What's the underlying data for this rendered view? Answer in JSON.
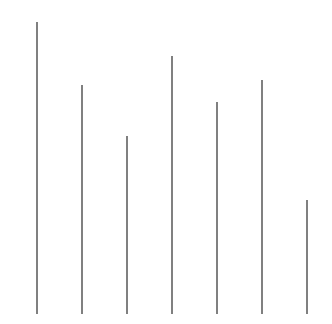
{
  "chart_data": {
    "type": "bar",
    "title": "",
    "subtitle": "",
    "xlabel": "",
    "ylabel": "",
    "categories": [
      "1",
      "2",
      "3",
      "4",
      "5",
      "6",
      "7"
    ],
    "values": [
      292,
      229,
      178,
      258,
      212,
      234,
      114
    ],
    "ylim": [
      0,
      302
    ],
    "xlim": [
      0,
      332
    ],
    "grid": false,
    "legend": null,
    "legend_position": "none",
    "tick_labels_x": [],
    "tick_labels_y": [],
    "annotations": [],
    "bar_color": "#808080",
    "background_color": "#ffffff",
    "bar_width_px": 2,
    "baseline_y_px": 314,
    "bars": [
      {
        "label": "1",
        "value": 292,
        "x_px": 36,
        "top_px": 22,
        "height_px": 292,
        "width_px": 2,
        "color": "#808080"
      },
      {
        "label": "2",
        "value": 229,
        "x_px": 81,
        "top_px": 85,
        "height_px": 229,
        "width_px": 2,
        "color": "#808080"
      },
      {
        "label": "3",
        "value": 178,
        "x_px": 126,
        "top_px": 136,
        "height_px": 178,
        "width_px": 2,
        "color": "#808080"
      },
      {
        "label": "4",
        "value": 258,
        "x_px": 171,
        "top_px": 56,
        "height_px": 258,
        "width_px": 2,
        "color": "#808080"
      },
      {
        "label": "5",
        "value": 212,
        "x_px": 216,
        "top_px": 102,
        "height_px": 212,
        "width_px": 2,
        "color": "#808080"
      },
      {
        "label": "6",
        "value": 234,
        "x_px": 261,
        "top_px": 80,
        "height_px": 234,
        "width_px": 2,
        "color": "#808080"
      },
      {
        "label": "7",
        "value": 114,
        "x_px": 306,
        "top_px": 200,
        "height_px": 114,
        "width_px": 2,
        "color": "#808080"
      }
    ]
  }
}
